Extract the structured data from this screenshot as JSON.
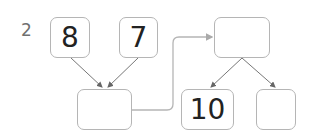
{
  "problem_number": "2",
  "boxes": {
    "top_left": "8",
    "top_middle": "7",
    "sum": "",
    "top_right": "",
    "bottom_middle": "10",
    "bottom_right": ""
  },
  "colors": {
    "box_border": "#b5b5b5",
    "arrow": "#666666",
    "connector": "#b5b5b5"
  }
}
